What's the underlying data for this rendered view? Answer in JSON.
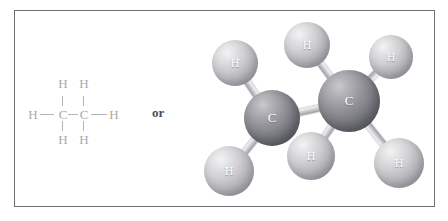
{
  "figure": {
    "connector_label": "or",
    "frame_color": "#6f6f72",
    "background_color": "#ffffff"
  },
  "structural_formula": {
    "molecule": "ethane",
    "formula": "C2H6",
    "atom_color": "#a9a9ae",
    "bond_color": "#b3b3b8",
    "atoms": [
      {
        "symbol": "H",
        "position": "top-left",
        "x": 30,
        "y": 9
      },
      {
        "symbol": "H",
        "position": "top-right",
        "x": 51,
        "y": 9
      },
      {
        "symbol": "H",
        "position": "left-end",
        "x": 0,
        "y": 34
      },
      {
        "symbol": "C",
        "position": "carbon-left",
        "x": 30,
        "y": 34
      },
      {
        "symbol": "C",
        "position": "carbon-right",
        "x": 51,
        "y": 34
      },
      {
        "symbol": "H",
        "position": "right-end",
        "x": 81,
        "y": 34
      },
      {
        "symbol": "H",
        "position": "bottom-left",
        "x": 30,
        "y": 59
      },
      {
        "symbol": "H",
        "position": "bottom-right",
        "x": 51,
        "y": 59
      }
    ]
  },
  "ball_and_stick": {
    "molecule": "ethane",
    "carbon_color": "#7c7c83",
    "hydrogen_color": "#cfcfd2",
    "bond_color": "#d0d0d4",
    "atoms": [
      {
        "symbol": "H",
        "id": "h-upper-left",
        "cx": 235,
        "cy": 63,
        "r": 23
      },
      {
        "symbol": "H",
        "id": "h-upper-mid",
        "cx": 307,
        "cy": 45,
        "r": 23
      },
      {
        "symbol": "H",
        "id": "h-upper-right",
        "cx": 391,
        "cy": 57,
        "r": 22
      },
      {
        "symbol": "C",
        "id": "c-left",
        "cx": 272,
        "cy": 118,
        "r": 28
      },
      {
        "symbol": "C",
        "id": "c-right",
        "cx": 349,
        "cy": 101,
        "r": 31
      },
      {
        "symbol": "H",
        "id": "h-lower-left",
        "cx": 229,
        "cy": 171,
        "r": 25
      },
      {
        "symbol": "H",
        "id": "h-lower-mid",
        "cx": 311,
        "cy": 156,
        "r": 24
      },
      {
        "symbol": "H",
        "id": "h-lower-right",
        "cx": 399,
        "cy": 163,
        "r": 25
      }
    ],
    "bonds": [
      {
        "from": "h-upper-left",
        "to": "c-left"
      },
      {
        "from": "h-lower-left",
        "to": "c-left"
      },
      {
        "from": "c-left",
        "to": "c-right"
      },
      {
        "from": "h-upper-mid",
        "to": "c-right"
      },
      {
        "from": "h-upper-right",
        "to": "c-right"
      },
      {
        "from": "h-lower-mid",
        "to": "c-right"
      },
      {
        "from": "h-lower-right",
        "to": "c-right"
      }
    ]
  }
}
